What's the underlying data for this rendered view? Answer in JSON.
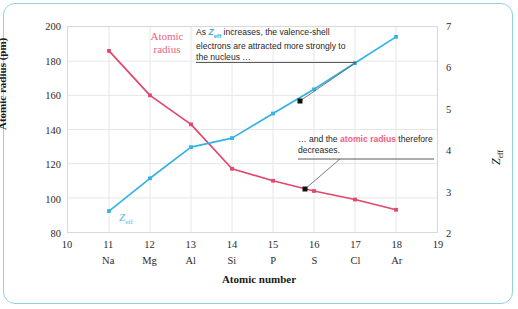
{
  "figure": {
    "frame_color": "#8fd3e0",
    "background": "#ffffff"
  },
  "chart_data": {
    "type": "line",
    "title": "",
    "xlabel": "Atomic number",
    "ylabel": "Atomic radius (pm)",
    "ylabel_right": "Zeff",
    "xlim": [
      10,
      19
    ],
    "ylim": [
      80,
      200
    ],
    "ylim_right": [
      2,
      7
    ],
    "grid": true,
    "legend": "inline-labels",
    "x": [
      11,
      12,
      13,
      14,
      15,
      16,
      17,
      18
    ],
    "categories": [
      "Na",
      "Mg",
      "Al",
      "Si",
      "P",
      "S",
      "Cl",
      "Ar"
    ],
    "xticks": [
      10,
      11,
      12,
      13,
      14,
      15,
      16,
      17,
      18,
      19
    ],
    "xticklabels": [
      "10",
      "11",
      "12",
      "13",
      "14",
      "15",
      "16",
      "17",
      "18",
      "19"
    ],
    "yticks_left": [
      80,
      100,
      120,
      140,
      160,
      180,
      200
    ],
    "yticklabels_left": [
      "80",
      "100",
      "120",
      "140",
      "160",
      "180",
      "200"
    ],
    "yticks_right": [
      2,
      3,
      4,
      5,
      6,
      7
    ],
    "yticklabels_right": [
      "2",
      "3",
      "4",
      "5",
      "6",
      "7"
    ],
    "series": [
      {
        "name": "Atomic radius",
        "axis": "left",
        "color": "#e3456b",
        "unit": "pm",
        "values": [
          186,
          160,
          143,
          117,
          110,
          104,
          99,
          93
        ]
      },
      {
        "name": "Zeff",
        "axis": "right",
        "color": "#33b3e3",
        "unit": "",
        "values": [
          2.51,
          3.31,
          4.07,
          4.29,
          4.89,
          5.48,
          6.12,
          6.76
        ]
      }
    ]
  },
  "labels": {
    "atomic_radius_line1": "Atomic",
    "atomic_radius_line2": "radius",
    "zeff_label": "Z",
    "zeff_sub": "eff",
    "x_axis_title": "Atomic number",
    "y_axis_title_left": "Atomic radius (pm)",
    "y_axis_title_right": "Z",
    "y_axis_title_right_sub": "eff"
  },
  "annotations": {
    "first": {
      "prefix": "As ",
      "symbol": "Z",
      "symbol_sub": "eff",
      "body": " increases, the valence-shell electrons are attracted more strongly to the nucleus …"
    },
    "second": {
      "prefix": "… and the ",
      "highlight": "atomic radius",
      "body": " therefore decreases."
    }
  }
}
